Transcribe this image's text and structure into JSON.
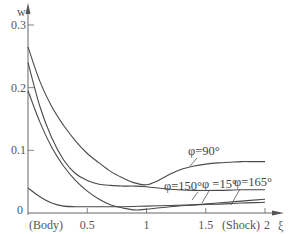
{
  "chart_data": {
    "type": "line",
    "title": "",
    "xlabel": "ξ",
    "ylabel": "w",
    "xlim": [
      0,
      2.1
    ],
    "ylim": [
      0,
      0.32
    ],
    "grid": false,
    "legend": "inline annotations",
    "x_ticks": [
      {
        "value": 0.5,
        "label": "0.5"
      },
      {
        "value": 1,
        "label": "1"
      },
      {
        "value": 1.5,
        "label": "1.5"
      },
      {
        "value": 2,
        "label": "2"
      }
    ],
    "y_ticks": [
      {
        "value": 0,
        "label": "0"
      },
      {
        "value": 0.1,
        "label": "0.1"
      },
      {
        "value": 0.2,
        "label": "0.2"
      },
      {
        "value": 0.3,
        "label": "0.3"
      }
    ],
    "x_annotations": {
      "body": "(Body)",
      "shock": "(Shock)"
    },
    "series": [
      {
        "name": "φ=90°",
        "x": [
          0,
          0.1,
          0.2,
          0.3,
          0.4,
          0.5,
          0.6,
          0.7,
          0.8,
          0.9,
          1.0,
          1.1,
          1.2,
          1.3,
          1.4,
          1.5,
          1.6,
          1.7,
          1.8,
          1.9,
          2.0
        ],
        "y": [
          0.265,
          0.21,
          0.17,
          0.14,
          0.115,
          0.095,
          0.08,
          0.066,
          0.056,
          0.048,
          0.045,
          0.052,
          0.062,
          0.07,
          0.075,
          0.078,
          0.08,
          0.081,
          0.082,
          0.082,
          0.082
        ]
      },
      {
        "name": "φ=150°",
        "x": [
          0,
          0.1,
          0.2,
          0.3,
          0.4,
          0.5,
          0.6,
          0.7,
          0.8,
          0.9,
          1.0,
          1.2,
          1.4,
          1.6,
          1.8,
          2.0
        ],
        "y": [
          0.24,
          0.17,
          0.12,
          0.085,
          0.063,
          0.052,
          0.046,
          0.044,
          0.043,
          0.043,
          0.042,
          0.038,
          0.036,
          0.036,
          0.037,
          0.037
        ]
      },
      {
        "name": "φ=15°",
        "x": [
          0,
          0.1,
          0.2,
          0.3,
          0.4,
          0.5,
          0.6,
          0.7,
          0.8,
          0.9,
          1.0,
          1.2,
          1.4,
          1.6,
          1.8,
          2.0
        ],
        "y": [
          0.195,
          0.145,
          0.105,
          0.075,
          0.052,
          0.035,
          0.022,
          0.013,
          0.008,
          0.005,
          0.006,
          0.01,
          0.013,
          0.016,
          0.019,
          0.022
        ]
      },
      {
        "name": "φ=165°",
        "x": [
          0,
          0.1,
          0.2,
          0.3,
          0.4,
          0.5,
          0.6,
          0.8,
          1.0,
          1.2,
          1.4,
          1.6,
          1.8,
          2.0
        ],
        "y": [
          0.04,
          0.026,
          0.016,
          0.011,
          0.01,
          0.01,
          0.01,
          0.01,
          0.011,
          0.012,
          0.013,
          0.014,
          0.016,
          0.017
        ]
      }
    ],
    "labels": {
      "phi90": "φ=90°",
      "phi150": "φ=150°",
      "phi15": "φ =15°",
      "phi165": "φ=165°"
    }
  }
}
